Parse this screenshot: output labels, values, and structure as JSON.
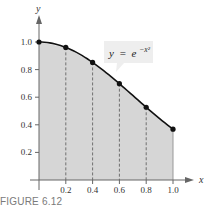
{
  "figure": {
    "caption": "FIGURE 6.12"
  },
  "chart_data": {
    "type": "line",
    "title": "",
    "xlabel": "x",
    "ylabel": "y",
    "xlim": [
      0,
      1.1
    ],
    "ylim": [
      0,
      1.1
    ],
    "grid": false,
    "x_ticks": [
      "0.2",
      "0.4",
      "0.6",
      "0.8",
      "1.0"
    ],
    "y_ticks": [
      "0.2",
      "0.4",
      "0.6",
      "0.8",
      "1.0"
    ],
    "series": [
      {
        "name": "y = e^{-x^2}",
        "x": [
          0,
          0.2,
          0.4,
          0.6,
          0.8,
          1.0
        ],
        "values": [
          1.0,
          0.961,
          0.852,
          0.698,
          0.527,
          0.368
        ]
      }
    ],
    "annotation": {
      "label_y": "y",
      "label_eq": "=",
      "label_e": "e",
      "label_exp": "−x²"
    },
    "shaded_region": "area under curve from x=0 to x=1, divided by dashed vertical lines at x=0.2,0.4,0.6,0.8",
    "colors": {
      "fill": "#d6d6d6",
      "curve": "#111111",
      "axis": "#555555",
      "label_box": "#eeeeee"
    }
  }
}
